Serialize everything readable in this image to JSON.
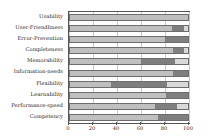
{
  "chart_data": {
    "type": "bar",
    "orientation": "horizontal",
    "stacked": true,
    "title": "",
    "subtitle": "",
    "xlabel": "",
    "ylabel": "",
    "xlim": [
      0,
      100
    ],
    "xticks": [
      0,
      20,
      40,
      60,
      80,
      100
    ],
    "xticklabels": [
      "0",
      "20",
      "40",
      "60",
      "80",
      "100"
    ],
    "grid": true,
    "grid_axis": "x",
    "legend": "none",
    "categories": [
      "Usability",
      "User-Friendliness",
      "Error-Prevention",
      "Completeness",
      "Memorability",
      "Information-needs",
      "Flexibility",
      "Learnability",
      "Performance-speed",
      "Competency"
    ],
    "series": [
      {
        "name": "Positive",
        "color": "#bfbfbf",
        "values": [
          100,
          86,
          80,
          87,
          60,
          87,
          35,
          81,
          72,
          74
        ]
      },
      {
        "name": "Neutral",
        "color": "#7f7f7f",
        "values": [
          0,
          10,
          20,
          9,
          28,
          13,
          47,
          19,
          18,
          26
        ]
      },
      {
        "name": "Negative",
        "color": "#d9d9d9",
        "values": [
          0,
          4,
          0,
          4,
          12,
          0,
          18,
          0,
          10,
          0
        ]
      }
    ]
  },
  "colors": {
    "positive": "#bfbfbf",
    "neutral": "#7f7f7f",
    "negative": "#d9d9d9",
    "axis": "#555555",
    "grid": "#c9c9c9",
    "text": "#1a1a1a",
    "background": "#ffffff"
  }
}
